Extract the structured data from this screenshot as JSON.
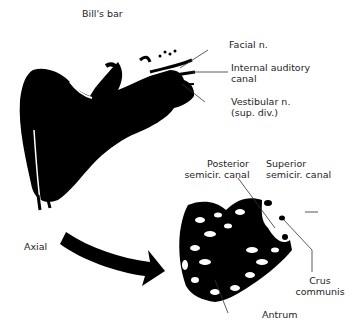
{
  "diagram": {
    "labels": {
      "bills_bar": "Bill's bar",
      "facial_n": "Facial n.",
      "iac_line1": "Internal auditory",
      "iac_line2": "canal",
      "vest_line1": "Vestibular n.",
      "vest_line2": "(sup. div.)",
      "axial": "Axial",
      "post_line1": "Posterior",
      "post_line2": "semicir. canal",
      "sup_line1": "Superior",
      "sup_line2": "semicir. canal",
      "crus_line1": "Crus",
      "crus_line2": "communis",
      "antrum": "Antrum"
    },
    "colors": {
      "ink": "#000000",
      "background": "#ffffff",
      "text": "#1e1e1e"
    }
  }
}
